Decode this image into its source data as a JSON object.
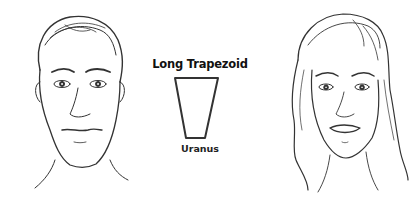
{
  "diagram": {
    "title": "Long Trapezoid",
    "shape": "trapezoid",
    "caption": "Uranus",
    "illustrations": [
      {
        "name": "male-face-sketch"
      },
      {
        "name": "female-face-sketch"
      }
    ]
  }
}
